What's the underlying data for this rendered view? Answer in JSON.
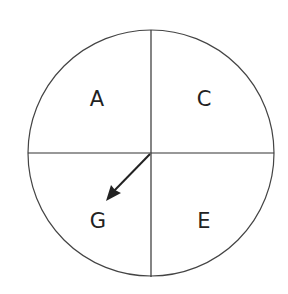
{
  "diagram": {
    "type": "spinner",
    "sections": [
      {
        "label": "A",
        "position": "top-left"
      },
      {
        "label": "C",
        "position": "top-right"
      },
      {
        "label": "G",
        "position": "bottom-left"
      },
      {
        "label": "E",
        "position": "bottom-right"
      }
    ],
    "pointer": {
      "points_to": "G",
      "direction": "down-left"
    },
    "colors": {
      "stroke": "#333333",
      "background": "#ffffff",
      "text": "#222222"
    }
  }
}
